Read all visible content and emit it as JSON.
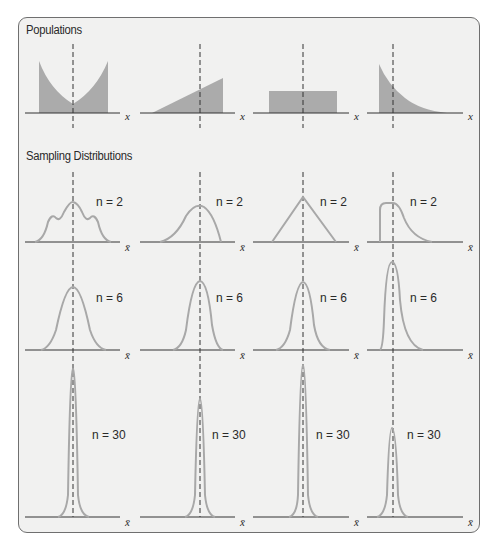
{
  "sections": {
    "populations_title": "Populations",
    "sampling_title": "Sampling Distributions"
  },
  "axis_labels": {
    "population": "x",
    "sampling": "x̄"
  },
  "colors": {
    "fill": "#9f9f9f",
    "curve": "#a8a8a8",
    "axis": "#333333",
    "dashed": "#333333",
    "panel": "#f1f1f0",
    "border": "#6f6f6f"
  },
  "populations": [
    {
      "shape": "U-shaped",
      "label": "x"
    },
    {
      "shape": "increasing-linear",
      "label": "x"
    },
    {
      "shape": "uniform",
      "label": "x"
    },
    {
      "shape": "exponential-decreasing",
      "label": "x"
    }
  ],
  "sampling_rows": [
    {
      "n_label": "n = 2",
      "labels": [
        "n = 2",
        "n = 2",
        "n = 2",
        "n = 2"
      ]
    },
    {
      "n_label": "n = 6",
      "labels": [
        "n = 6",
        "n = 6",
        "n = 6",
        "n = 6"
      ]
    },
    {
      "n_label": "n = 30",
      "labels": [
        "n = 30",
        "n = 30",
        "n = 30",
        "n = 30"
      ]
    }
  ]
}
